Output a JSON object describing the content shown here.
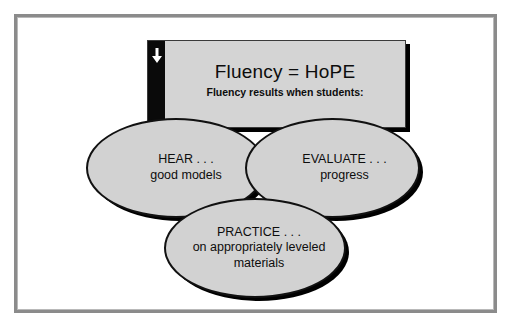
{
  "slide": {
    "frame_color": "#8b8b8b",
    "background_color": "#ffffff"
  },
  "banner": {
    "title": "Fluency = HoPE",
    "subtitle": "Fluency results when students:",
    "sidebar_color": "#0a0a0a",
    "body_color": "#d4d4d4",
    "arrow_icon": "down-arrow-icon"
  },
  "ellipses": [
    {
      "id": "hear",
      "title": "HEAR . . .",
      "subtitle": "good models",
      "fill_color": "#d2d2d2",
      "outline_color": "#111111"
    },
    {
      "id": "evaluate",
      "title": "EVALUATE . . .",
      "subtitle": "progress",
      "fill_color": "#d2d2d2",
      "outline_color": "#111111"
    },
    {
      "id": "practice",
      "title": "PRACTICE . . .",
      "subtitle": "on appropriately leveled",
      "subtitle2": "materials",
      "fill_color": "#d2d2d2",
      "outline_color": "#111111"
    }
  ]
}
